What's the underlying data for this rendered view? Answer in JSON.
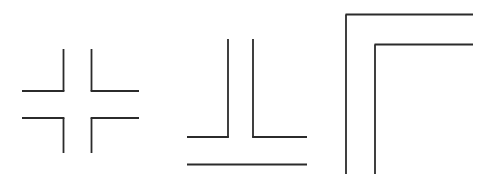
{
  "page": {
    "background_color": "#ffffff",
    "width": 185,
    "canvas_width": 488,
    "canvas_height": 185
  },
  "style": {
    "line_color": "#2b2b2b",
    "line_width": 1.8,
    "line_cap": "butt"
  },
  "figures": [
    {
      "id": "figure-1",
      "name": "illusory-cross",
      "label": "Cross formed by four corner brackets",
      "segments": [
        {
          "name": "top-left-vertical",
          "x1": 63.5,
          "y1": 49.0,
          "x2": 63.5,
          "y2": 91.0
        },
        {
          "name": "top-left-horizontal",
          "x1": 22.0,
          "y1": 91.0,
          "x2": 64.4,
          "y2": 91.0
        },
        {
          "name": "top-right-vertical",
          "x1": 91.5,
          "y1": 49.0,
          "x2": 91.5,
          "y2": 91.0
        },
        {
          "name": "top-right-horizontal",
          "x1": 90.6,
          "y1": 91.0,
          "x2": 139.0,
          "y2": 91.0
        },
        {
          "name": "bottom-left-horizontal",
          "x1": 22.0,
          "y1": 118.0,
          "x2": 64.4,
          "y2": 118.0
        },
        {
          "name": "bottom-left-vertical",
          "x1": 63.5,
          "y1": 118.0,
          "x2": 63.5,
          "y2": 153.0
        },
        {
          "name": "bottom-right-horizontal",
          "x1": 90.6,
          "y1": 118.0,
          "x2": 139.0,
          "y2": 118.0
        },
        {
          "name": "bottom-right-vertical",
          "x1": 91.5,
          "y1": 118.0,
          "x2": 91.5,
          "y2": 153.0
        }
      ]
    },
    {
      "id": "figure-2",
      "name": "inverted-t-with-rule",
      "label": "Two tall corners meeting in an inverted T above a separate horizontal line",
      "segments": [
        {
          "name": "left-corner-vertical",
          "x1": 228.0,
          "y1": 39.0,
          "x2": 228.0,
          "y2": 137.0
        },
        {
          "name": "left-corner-horizontal",
          "x1": 187.0,
          "y1": 137.0,
          "x2": 228.9,
          "y2": 137.0
        },
        {
          "name": "right-corner-vertical",
          "x1": 253.0,
          "y1": 39.0,
          "x2": 253.0,
          "y2": 137.0
        },
        {
          "name": "right-corner-horizontal",
          "x1": 252.1,
          "y1": 137.0,
          "x2": 307.0,
          "y2": 137.0
        },
        {
          "name": "baseline-rule",
          "x1": 187.0,
          "y1": 164.5,
          "x2": 307.0,
          "y2": 164.5
        }
      ]
    },
    {
      "id": "figure-3",
      "name": "nested-corners",
      "label": "Two nested right-angle corners open to the right and bottom",
      "segments": [
        {
          "name": "outer-corner-horizontal",
          "x1": 345.5,
          "y1": 14.5,
          "x2": 473.0,
          "y2": 14.5
        },
        {
          "name": "outer-corner-vertical",
          "x1": 346.0,
          "y1": 14.5,
          "x2": 346.0,
          "y2": 174.0
        },
        {
          "name": "inner-corner-horizontal",
          "x1": 374.5,
          "y1": 44.5,
          "x2": 473.0,
          "y2": 44.5
        },
        {
          "name": "inner-corner-vertical",
          "x1": 375.0,
          "y1": 44.5,
          "x2": 375.0,
          "y2": 174.0
        }
      ]
    }
  ]
}
